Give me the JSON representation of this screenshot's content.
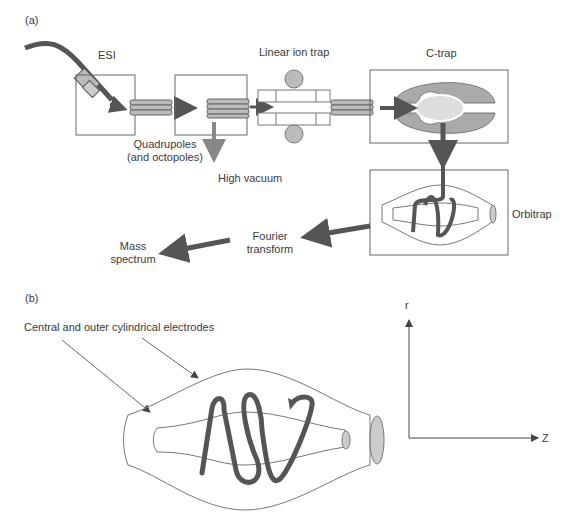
{
  "panel_a": {
    "label": "(a)",
    "esi": "ESI",
    "linear_ion_trap": "Linear ion trap",
    "c_trap": "C-trap",
    "quadrupoles_line1": "Quadrupoles",
    "quadrupoles_line2": "(and octopoles)",
    "high_vacuum": "High vacuum",
    "orbitrap": "Orbitrap",
    "fourier_line1": "Fourier",
    "fourier_line2": "transform",
    "mass_line1": "Mass",
    "mass_line2": "spectrum"
  },
  "panel_b": {
    "label": "(b)",
    "electrodes": "Central and outer cylindrical electrodes",
    "axis_r": "r",
    "axis_z": "Z"
  },
  "colors": {
    "dark_arrow": "#555555",
    "light_fill": "#c8c8c8",
    "line": "#666666"
  }
}
